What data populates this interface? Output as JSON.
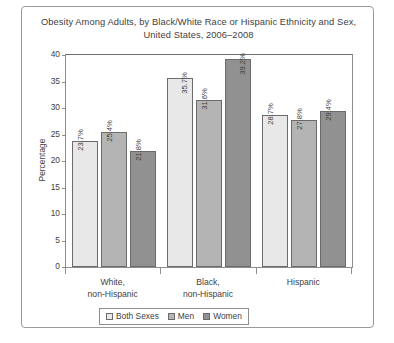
{
  "chart_data": {
    "type": "bar",
    "title": "Obesity Among Adults, by Black/White Race or Hispanic Ethnicity and Sex,",
    "title_line2": "United States, 2006–2008",
    "xlabel": "",
    "ylabel": "Percentage",
    "ylim": [
      0,
      40
    ],
    "ytick_step": 5,
    "yticks": [
      "40",
      "35",
      "30",
      "25",
      "20",
      "15",
      "10",
      "5",
      "0"
    ],
    "grid": false,
    "legend_position": "bottom-center",
    "categories": [
      "White, non-Hispanic",
      "Black, non-Hispanic",
      "Hispanic"
    ],
    "category_lines": [
      {
        "l1": "White,",
        "l2": "non-Hispanic"
      },
      {
        "l1": "Black,",
        "l2": "non-Hispanic"
      },
      {
        "l1": "Hispanic",
        "l2": ""
      }
    ],
    "series": [
      {
        "name": "Both Sexes",
        "color": "#e8e8e8",
        "values": [
          23.7,
          35.7,
          28.7
        ],
        "labels": [
          "23.7%",
          "35.7%",
          "28.7%"
        ]
      },
      {
        "name": "Men",
        "color": "#b4b4b4",
        "values": [
          25.4,
          31.6,
          27.8
        ],
        "labels": [
          "25.4%",
          "31.6%",
          "27.8%"
        ]
      },
      {
        "name": "Women",
        "color": "#919191",
        "values": [
          21.8,
          39.2,
          29.4
        ],
        "labels": [
          "21.8%",
          "39.2%",
          "29.4%"
        ]
      }
    ]
  }
}
